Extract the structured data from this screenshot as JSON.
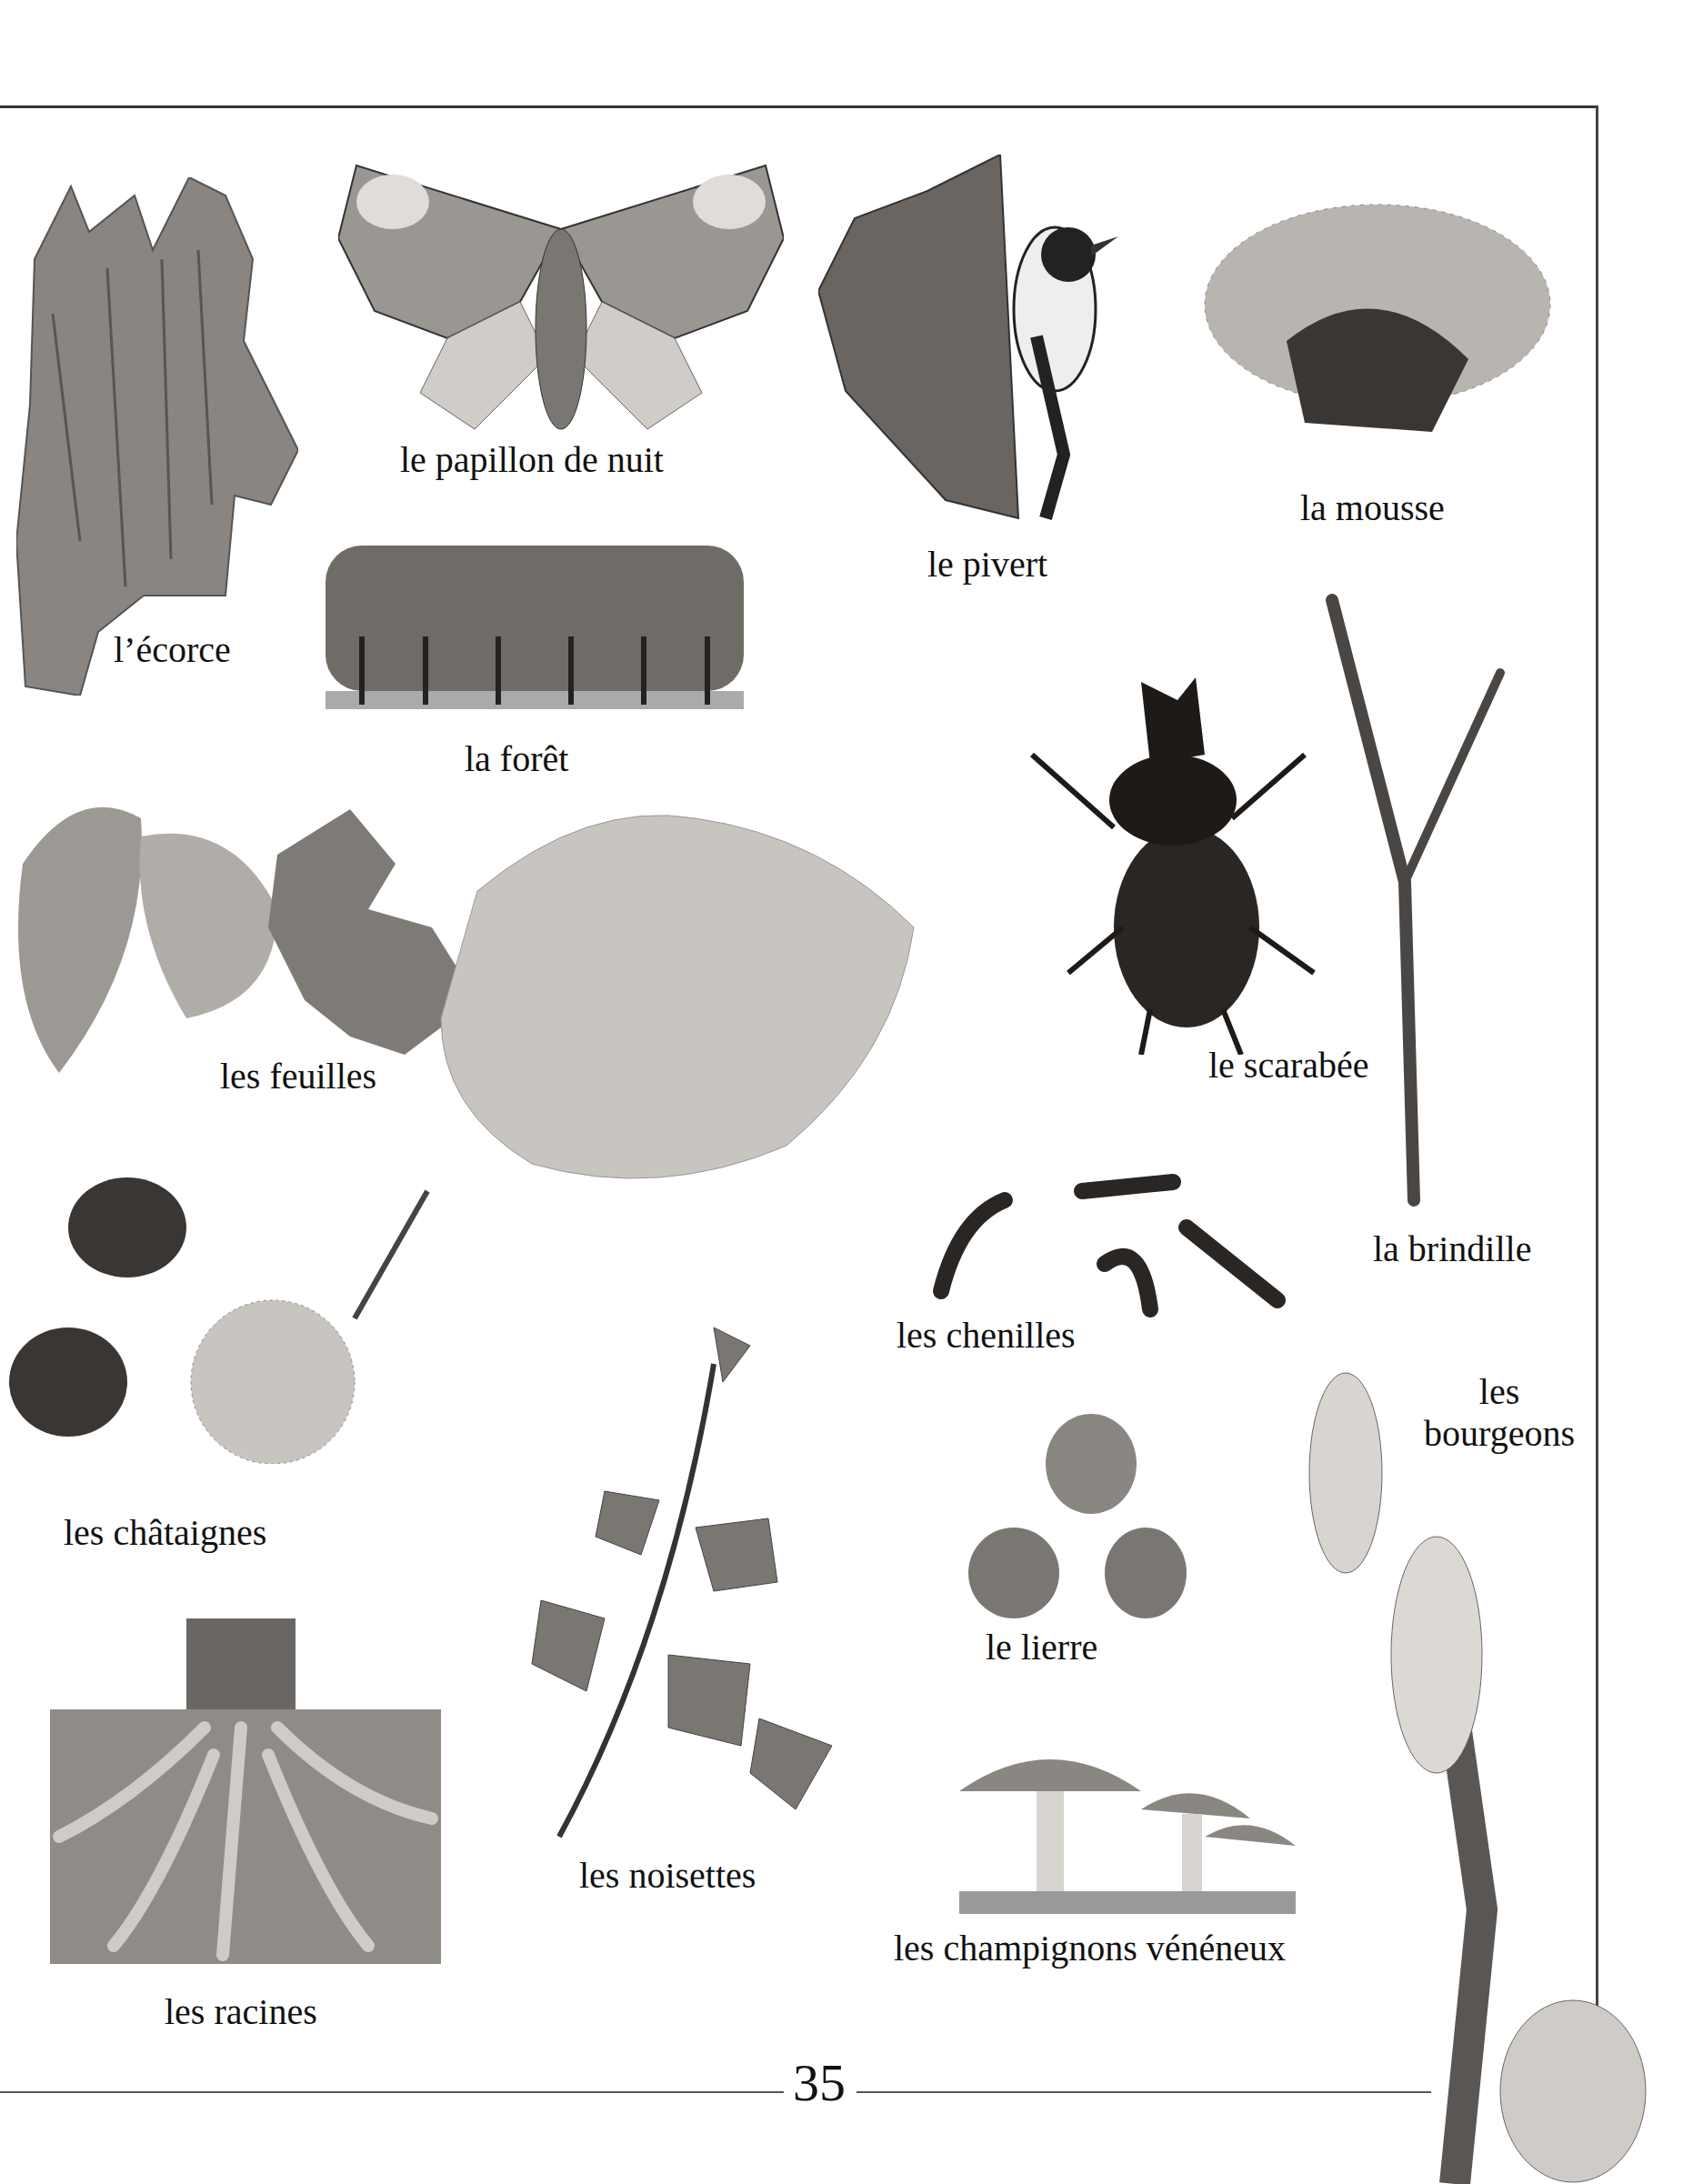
{
  "page": {
    "number": "35"
  },
  "items": [
    {
      "id": "ecorce",
      "label": "l’écorce"
    },
    {
      "id": "papillon",
      "label": "le papillon de nuit"
    },
    {
      "id": "pivert",
      "label": "le pivert"
    },
    {
      "id": "mousse",
      "label": "la mousse"
    },
    {
      "id": "foret",
      "label": "la forêt"
    },
    {
      "id": "feuilles",
      "label": "les feuilles"
    },
    {
      "id": "scarabee",
      "label": "le scarabée"
    },
    {
      "id": "brindille",
      "label": "la brindille"
    },
    {
      "id": "chenilles",
      "label": "les chenilles"
    },
    {
      "id": "bourgeons",
      "label_line1": "les",
      "label_line2": "bourgeons"
    },
    {
      "id": "chataignes",
      "label": "les châtaignes"
    },
    {
      "id": "noisettes",
      "label": "les noisettes"
    },
    {
      "id": "lierre",
      "label": "le lierre"
    },
    {
      "id": "champignons",
      "label": "les champignons vénéneux"
    },
    {
      "id": "racines",
      "label": "les racines"
    }
  ]
}
